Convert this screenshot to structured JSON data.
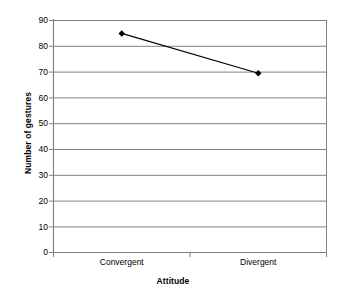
{
  "chart_data": {
    "type": "line",
    "title": "",
    "xlabel": "Attitude",
    "ylabel": "Number of gestures",
    "categories": [
      "Convergent",
      "Divergent"
    ],
    "values": [
      85,
      69.5
    ],
    "series": [
      {
        "name": "Number of gestures",
        "values": [
          85,
          69.5
        ]
      }
    ],
    "ylim": [
      0,
      90
    ],
    "ytick_labels": [
      "90",
      "80",
      "70",
      "60",
      "50",
      "40",
      "30",
      "20",
      "10",
      "0"
    ],
    "ytick_values": [
      90,
      80,
      70,
      60,
      50,
      40,
      30,
      20,
      10,
      0
    ],
    "ytick_step": 10,
    "grid": "horizontal",
    "legend": "none",
    "marker": "diamond",
    "line_color": "#000000",
    "marker_color": "#000000",
    "gridline_color": "#808080",
    "axis_color": "#808080",
    "plot_background": "#ffffff"
  }
}
